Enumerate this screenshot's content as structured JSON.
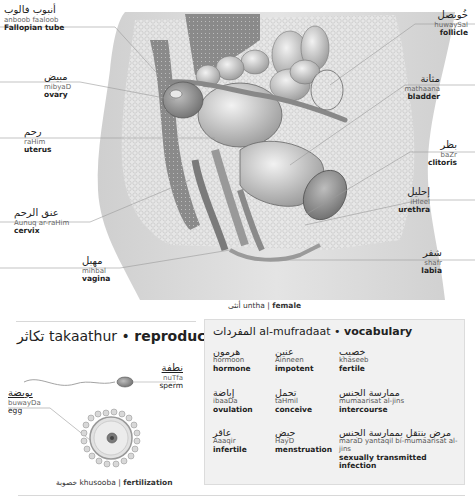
{
  "anatomy": {
    "labels": [
      {
        "id": "fallopian-tube",
        "arabic": "أنبوب فالوب",
        "translit": "anboob faaloob",
        "english": "Fallopian tube",
        "side": "left"
      },
      {
        "id": "ovary",
        "arabic": "مبيض",
        "translit": "mibyaD",
        "english": "ovary",
        "side": "left"
      },
      {
        "id": "uterus",
        "arabic": "رحم",
        "translit": "raHim",
        "english": "uterus",
        "side": "left"
      },
      {
        "id": "cervix",
        "arabic": "عنق الرحم",
        "translit": "Aunuq ar-raHim",
        "english": "cervix",
        "side": "left"
      },
      {
        "id": "vagina",
        "arabic": "مهبل",
        "translit": "mihbal",
        "english": "vagina",
        "side": "left"
      },
      {
        "id": "follicle",
        "arabic": "خُويصل",
        "translit": "huwaySal",
        "english": "follicle",
        "side": "right"
      },
      {
        "id": "bladder",
        "arabic": "مثانة",
        "translit": "mathaana",
        "english": "bladder",
        "side": "right"
      },
      {
        "id": "clitoris",
        "arabic": "بظر",
        "translit": "baZr",
        "english": "clitoris",
        "side": "right"
      },
      {
        "id": "urethra",
        "arabic": "إحليل",
        "translit": "iHleel",
        "english": "urethra",
        "side": "right"
      },
      {
        "id": "labia",
        "arabic": "شفر",
        "translit": "shafr",
        "english": "labia",
        "side": "right"
      }
    ],
    "caption": {
      "arabic": "أنثى",
      "translit": "untha",
      "separator": "|",
      "english": "female"
    }
  },
  "reproduction": {
    "title": {
      "arabic": "تكاثر",
      "translit": "takaathur",
      "bullet": "•",
      "english": "reproduction"
    },
    "sperm": {
      "arabic": "نطفة",
      "translit": "nuTfa",
      "english": "sperm"
    },
    "egg": {
      "arabic": "بويضة",
      "translit": "buwayDa",
      "english": "egg"
    },
    "caption": {
      "arabic": "خصوبة",
      "translit": "khusooba",
      "separator": "|",
      "english": "fertilization"
    }
  },
  "vocabulary": {
    "title": {
      "arabic": "المفردات",
      "translit": "al-mufradaat",
      "bullet": "•",
      "english": "vocabulary"
    },
    "items": [
      {
        "arabic": "هرمون",
        "translit": "hormoon",
        "english": "hormone"
      },
      {
        "arabic": "عنين",
        "translit": "Ainneen",
        "english": "impotent"
      },
      {
        "arabic": "خصيب",
        "translit": "khaseeb",
        "english": "fertile"
      },
      {
        "arabic": "إباضة",
        "translit": "ibaaDa",
        "english": "ovulation"
      },
      {
        "arabic": "تحمل",
        "translit": "taHmil",
        "english": "conceive"
      },
      {
        "arabic": "ممارسة الجنس",
        "translit": "mumaarisat al-jins",
        "english": "intercourse"
      },
      {
        "arabic": "عاقر",
        "translit": "Aaaqir",
        "english": "infertile"
      },
      {
        "arabic": "حيض",
        "translit": "HayD",
        "english": "menstruation"
      },
      {
        "arabic": "مرض ينتقل بممارسة الجنس",
        "translit": "maraD yantaqil bi-mumaarisat al-jins",
        "english": "sexually transmitted infection"
      }
    ]
  },
  "colors": {
    "text": "#222222",
    "translit": "#666666",
    "vocab_bg": "#f1f1f1",
    "rule": "#d8d8d8",
    "illustration": "#9a9a9a"
  }
}
